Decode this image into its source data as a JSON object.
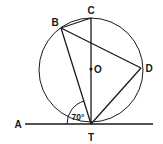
{
  "diagram": {
    "title": "",
    "type": "circle-geometry",
    "circle": {
      "cx": 91,
      "cy": 70,
      "r": 52
    },
    "points": {
      "A": {
        "label": "A",
        "x": 25,
        "y": 124,
        "lx": 18,
        "ly": 128
      },
      "T": {
        "label": "T",
        "x": 91,
        "y": 124,
        "lx": 91,
        "ly": 140
      },
      "C": {
        "label": "C",
        "x": 91,
        "y": 18,
        "lx": 91,
        "ly": 14
      },
      "B": {
        "label": "B",
        "x": 61,
        "y": 28,
        "lx": 55,
        "ly": 26
      },
      "D": {
        "label": "D",
        "x": 141,
        "y": 68,
        "lx": 149,
        "ly": 72
      },
      "O": {
        "label": "O",
        "x": 91,
        "y": 69,
        "lx": 98,
        "ly": 73
      }
    },
    "segments": [
      [
        "C",
        "T"
      ],
      [
        "B",
        "C"
      ],
      [
        "B",
        "T"
      ],
      [
        "B",
        "D"
      ],
      [
        "D",
        "T"
      ]
    ],
    "tangent_line": {
      "from": "A",
      "to_x": 153,
      "y": 124
    },
    "angle": {
      "vertex": "T",
      "label": "70°",
      "lx": 79,
      "ly": 120
    }
  }
}
